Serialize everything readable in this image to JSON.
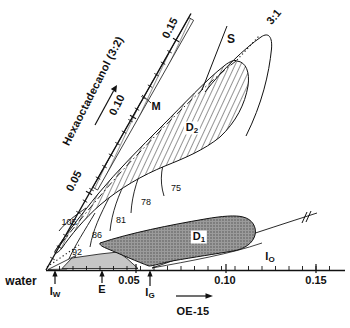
{
  "colors": {
    "ink": "#111111",
    "e_region_fill": "#c6c6c6",
    "d1_region_fill": "#9b9b9b",
    "background": "#ffffff"
  },
  "x_axis": {
    "origin_label": "water",
    "title": "OE-15",
    "ticks": [
      "0.05",
      "0.10",
      "0.15"
    ]
  },
  "y_axis": {
    "title": "Hexaoctadecanol (3:2)",
    "ticks": [
      "0.05",
      "0.10",
      "0.15"
    ]
  },
  "ratio_line_label": "3:1",
  "regions": {
    "m": {
      "label": "M"
    },
    "s": {
      "label": "S"
    },
    "d2": {
      "main": "D",
      "sub": "2"
    },
    "d1": {
      "main": "D",
      "sub": "1"
    },
    "io": {
      "main": "I",
      "sub": "O"
    },
    "iw": {
      "main": "I",
      "sub": "W"
    },
    "e": {
      "label": "E"
    },
    "ig": {
      "main": "I",
      "sub": "G"
    }
  },
  "contours": [
    "105",
    "92",
    "86",
    "81",
    "78",
    "75"
  ]
}
